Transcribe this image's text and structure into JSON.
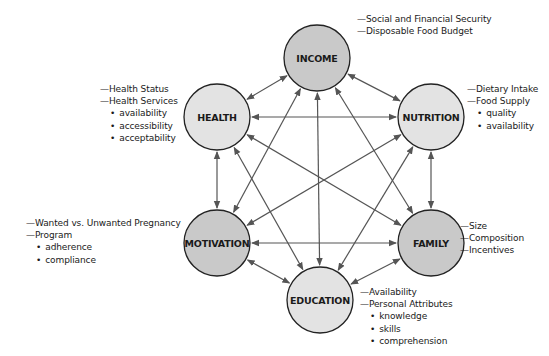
{
  "diagram": {
    "colors": {
      "dark_node": "#c9c9c9",
      "light_node": "#e3e3e3",
      "stroke": "#222222",
      "arrow": "#555555"
    },
    "nodes": [
      {
        "id": "income",
        "label": "INCOME",
        "cx": 317,
        "cy": 58,
        "r": 33,
        "shade": "dark"
      },
      {
        "id": "health",
        "label": "HEALTH",
        "cx": 217,
        "cy": 117,
        "r": 33,
        "shade": "light"
      },
      {
        "id": "nutrition",
        "label": "NUTRITION",
        "cx": 431,
        "cy": 117,
        "r": 33,
        "shade": "light"
      },
      {
        "id": "motivation",
        "label": "MOTIVATION",
        "cx": 217,
        "cy": 243,
        "r": 33,
        "shade": "dark"
      },
      {
        "id": "family",
        "label": "FAMILY",
        "cx": 431,
        "cy": 243,
        "r": 33,
        "shade": "dark"
      },
      {
        "id": "education",
        "label": "EDUCATION",
        "cx": 320,
        "cy": 300,
        "r": 33,
        "shade": "light"
      }
    ],
    "edges": [
      [
        "income",
        "health"
      ],
      [
        "income",
        "nutrition"
      ],
      [
        "income",
        "motivation"
      ],
      [
        "income",
        "family"
      ],
      [
        "income",
        "education"
      ],
      [
        "health",
        "nutrition"
      ],
      [
        "health",
        "motivation"
      ],
      [
        "health",
        "family"
      ],
      [
        "health",
        "education"
      ],
      [
        "nutrition",
        "motivation"
      ],
      [
        "nutrition",
        "family"
      ],
      [
        "nutrition",
        "education"
      ],
      [
        "motivation",
        "family"
      ],
      [
        "motivation",
        "education"
      ],
      [
        "family",
        "education"
      ]
    ],
    "annotations": {
      "income": {
        "items": [
          {
            "type": "dash",
            "text": "Social and Financial Security"
          },
          {
            "type": "dash",
            "text": "Disposable Food Budget"
          }
        ]
      },
      "health": {
        "items": [
          {
            "type": "dash",
            "text": "Health Status"
          },
          {
            "type": "dash",
            "text": "Health Services"
          },
          {
            "type": "bullet",
            "text": "availability"
          },
          {
            "type": "bullet",
            "text": "accessibility"
          },
          {
            "type": "bullet",
            "text": "acceptability"
          }
        ]
      },
      "nutrition": {
        "items": [
          {
            "type": "dash",
            "text": "Dietary Intake"
          },
          {
            "type": "dash",
            "text": "Food Supply"
          },
          {
            "type": "bullet",
            "text": "quality"
          },
          {
            "type": "bullet",
            "text": "availability"
          }
        ]
      },
      "motivation": {
        "items": [
          {
            "type": "dash",
            "text": "Wanted vs. Unwanted Pregnancy"
          },
          {
            "type": "dash",
            "text": "Program"
          },
          {
            "type": "bullet",
            "text": "adherence"
          },
          {
            "type": "bullet",
            "text": "compliance"
          }
        ]
      },
      "family": {
        "items": [
          {
            "type": "dash",
            "text": "Size"
          },
          {
            "type": "dash",
            "text": "Composition"
          },
          {
            "type": "dash",
            "text": "Incentives"
          }
        ]
      },
      "education": {
        "items": [
          {
            "type": "dash",
            "text": "Availability"
          },
          {
            "type": "dash",
            "text": "Personal Attributes"
          },
          {
            "type": "bullet",
            "text": "knowledge"
          },
          {
            "type": "bullet",
            "text": "skills"
          },
          {
            "type": "bullet",
            "text": "comprehension"
          }
        ]
      }
    }
  }
}
